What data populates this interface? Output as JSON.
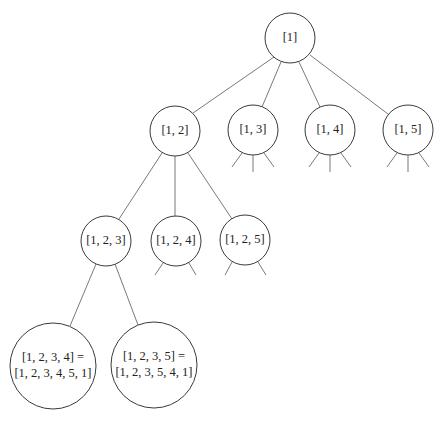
{
  "diagram": {
    "type": "search-tree",
    "nodes": [
      {
        "id": "n1",
        "label": "[1]",
        "cx": 290,
        "cy": 38,
        "r": 25
      },
      {
        "id": "n12",
        "label": "[1, 2]",
        "cx": 175,
        "cy": 131,
        "r": 25
      },
      {
        "id": "n13",
        "label": "[1, 3]",
        "cx": 253,
        "cy": 130,
        "r": 25
      },
      {
        "id": "n14",
        "label": "[1, 4]",
        "cx": 330,
        "cy": 130,
        "r": 25
      },
      {
        "id": "n15",
        "label": "[1, 5]",
        "cx": 408,
        "cy": 130,
        "r": 25
      },
      {
        "id": "n123",
        "label": "[1, 2, 3]",
        "cx": 106,
        "cy": 241,
        "r": 25
      },
      {
        "id": "n124",
        "label": "[1, 2, 4]",
        "cx": 176,
        "cy": 241,
        "r": 25
      },
      {
        "id": "n125",
        "label": "[1, 2, 5]",
        "cx": 245,
        "cy": 240,
        "r": 25
      },
      {
        "id": "n1234",
        "label_line1": "[1, 2, 3, 4] =",
        "label_line2": "[1, 2, 3, 4, 5, 1]",
        "cx": 53,
        "cy": 366,
        "r": 43
      },
      {
        "id": "n1235",
        "label_line1": "[1, 2, 3, 5] =",
        "label_line2": "[1, 2, 3, 5, 4, 1]",
        "cx": 154,
        "cy": 365,
        "r": 43
      }
    ],
    "edges": [
      [
        "n1",
        "n12"
      ],
      [
        "n1",
        "n13"
      ],
      [
        "n1",
        "n14"
      ],
      [
        "n1",
        "n15"
      ],
      [
        "n12",
        "n123"
      ],
      [
        "n12",
        "n124"
      ],
      [
        "n12",
        "n125"
      ],
      [
        "n123",
        "n1234"
      ],
      [
        "n123",
        "n1235"
      ]
    ],
    "truncated_stubs": {
      "n13": 3,
      "n14": 3,
      "n15": 3,
      "n124": 2,
      "n125": 2
    }
  }
}
